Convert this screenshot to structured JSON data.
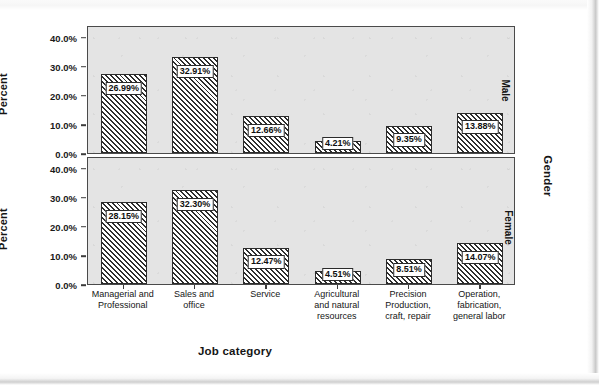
{
  "chart_data": {
    "type": "bar",
    "title": "",
    "xlabel": "Job category",
    "ylabel": "Percent",
    "panel_axis_label": "Gender",
    "ylim": [
      0,
      44
    ],
    "yticks": [
      0,
      10,
      20,
      30,
      40
    ],
    "ytick_labels": [
      "0.0%",
      "10.0%",
      "20.0%",
      "30.0%",
      "40.0%"
    ],
    "grid": false,
    "legend": "none",
    "layout": "stacked-panels-by-gender",
    "categories": [
      "Managerial and\nProfessional",
      "Sales and\noffice",
      "Service",
      "Agricultural\nand natural\nresources",
      "Precision\nProduction,\ncraft, repair",
      "Operation,\nfabrication,\ngeneral labor"
    ],
    "series": [
      {
        "name": "Male",
        "values": [
          26.99,
          32.91,
          12.66,
          4.21,
          9.35,
          13.88
        ],
        "labels": [
          "26.99%",
          "32.91%",
          "12.66%",
          "4.21%",
          "9.35%",
          "13.88%"
        ]
      },
      {
        "name": "Female",
        "values": [
          28.15,
          32.3,
          12.47,
          4.51,
          8.51,
          14.07
        ],
        "labels": [
          "28.15%",
          "32.30%",
          "12.47%",
          "4.51%",
          "8.51%",
          "14.07%"
        ]
      }
    ]
  },
  "panels": [
    {
      "strip_label": "Male"
    },
    {
      "strip_label": "Female"
    }
  ],
  "colors": {
    "panel_background": "#e4e4e4",
    "panel_border": "#4a4a4a",
    "bar_outline": "#2b2b2b",
    "bar_hatch": "#2e2e2e",
    "text": "#151515",
    "page_background": "#ffffff"
  }
}
